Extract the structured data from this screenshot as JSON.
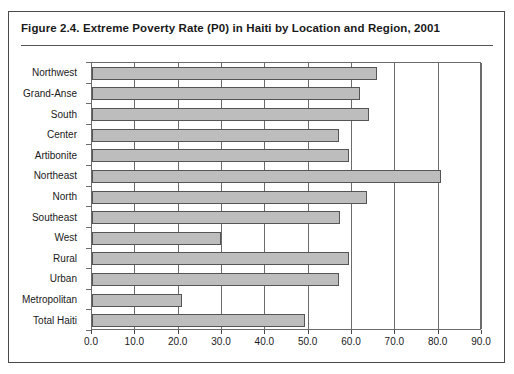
{
  "figure": {
    "title": "Figure 2.4.   Extreme Poverty Rate (P0) in Haiti by Location and Region, 2001",
    "border_color": "#4a4a4a",
    "bar_fill_color": "#bdbdbd",
    "bar_edge_color": "#555555",
    "axis_color": "#6b6b6b"
  },
  "chart_data": {
    "type": "bar",
    "orientation": "horizontal",
    "title": "Figure 2.4.   Extreme Poverty Rate (P0) in Haiti by Location and Region, 2001",
    "xlabel": "",
    "ylabel": "",
    "categories": [
      "Northwest",
      "Grand-Anse",
      "South",
      "Center",
      "Artibonite",
      "Northeast",
      "North",
      "Southeast",
      "West",
      "Rural",
      "Urban",
      "Metropolitan",
      "Total Haiti"
    ],
    "values": [
      65.8,
      61.8,
      64.0,
      56.9,
      59.2,
      80.5,
      63.5,
      57.2,
      29.8,
      59.2,
      56.9,
      20.7,
      49.2
    ],
    "xlim": [
      0.0,
      90.0
    ],
    "xticks": [
      0.0,
      10.0,
      20.0,
      30.0,
      40.0,
      50.0,
      60.0,
      70.0,
      80.0,
      90.0
    ],
    "xtick_labels": [
      "0.0",
      "10.0",
      "20.0",
      "30.0",
      "40.0",
      "50.0",
      "60.0",
      "70.0",
      "80.0",
      "90.0"
    ],
    "grid": "vertical",
    "legend": null
  }
}
